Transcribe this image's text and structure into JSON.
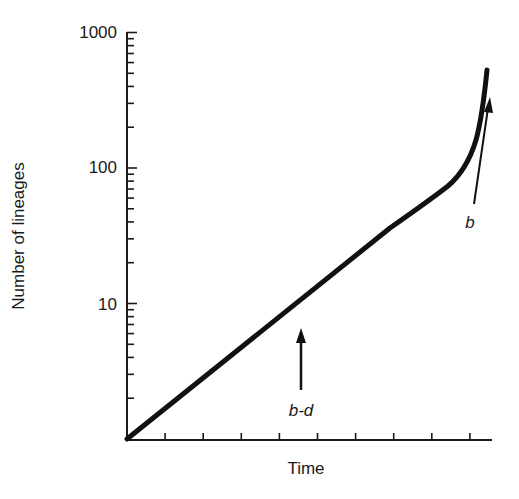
{
  "chart_data": {
    "type": "line",
    "title": "",
    "xlabel": "Time",
    "ylabel": "Number of lineages",
    "yscale": "log",
    "ylim": [
      1,
      1000
    ],
    "yticks": [
      {
        "value": 10,
        "label": "10"
      },
      {
        "value": 100,
        "label": "100"
      },
      {
        "value": 1000,
        "label": "1000"
      }
    ],
    "xticks_count": 9,
    "xtick_labels": [],
    "grid": false,
    "legend": null,
    "series": [
      {
        "name": "lineages-through-time",
        "description": "Straight line on log scale (constant net diversification b-d), then upturn near present (pull of the present, slope approaches b)",
        "x": [
          0,
          0.1,
          0.2,
          0.3,
          0.4,
          0.5,
          0.6,
          0.7,
          0.8,
          0.88,
          0.93,
          0.96,
          0.98,
          1.0
        ],
        "y": [
          1,
          1.9,
          3.6,
          6.8,
          12.8,
          24,
          37,
          50,
          80,
          120,
          170,
          250,
          390,
          550
        ]
      }
    ],
    "annotations": [
      {
        "label": "b-d",
        "type": "arrow-up",
        "x": 0.47,
        "description": "slope of the linear portion = net diversification rate"
      },
      {
        "label": "b",
        "type": "arrow-up",
        "x": 0.97,
        "description": "slope near present approaches speciation rate"
      }
    ]
  }
}
